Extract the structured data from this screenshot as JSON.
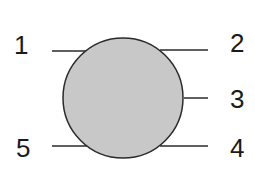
{
  "diagram": {
    "circle": {
      "cx": 123,
      "cy": 98,
      "r": 60,
      "fill": "#c8c8c8",
      "stroke": "#2a2a2a"
    },
    "pins": [
      {
        "label": "1",
        "x1": 52,
        "y1": 51,
        "x2": 88,
        "y2": 51,
        "lx": 14,
        "ly": 54
      },
      {
        "label": "2",
        "x1": 160,
        "y1": 50,
        "x2": 208,
        "y2": 50,
        "lx": 230,
        "ly": 52
      },
      {
        "label": "3",
        "x1": 184,
        "y1": 98,
        "x2": 208,
        "y2": 98,
        "lx": 230,
        "ly": 108
      },
      {
        "label": "4",
        "x1": 160,
        "y1": 146,
        "x2": 208,
        "y2": 146,
        "lx": 230,
        "ly": 157
      },
      {
        "label": "5",
        "x1": 52,
        "y1": 146,
        "x2": 88,
        "y2": 146,
        "lx": 16,
        "ly": 157
      }
    ]
  }
}
